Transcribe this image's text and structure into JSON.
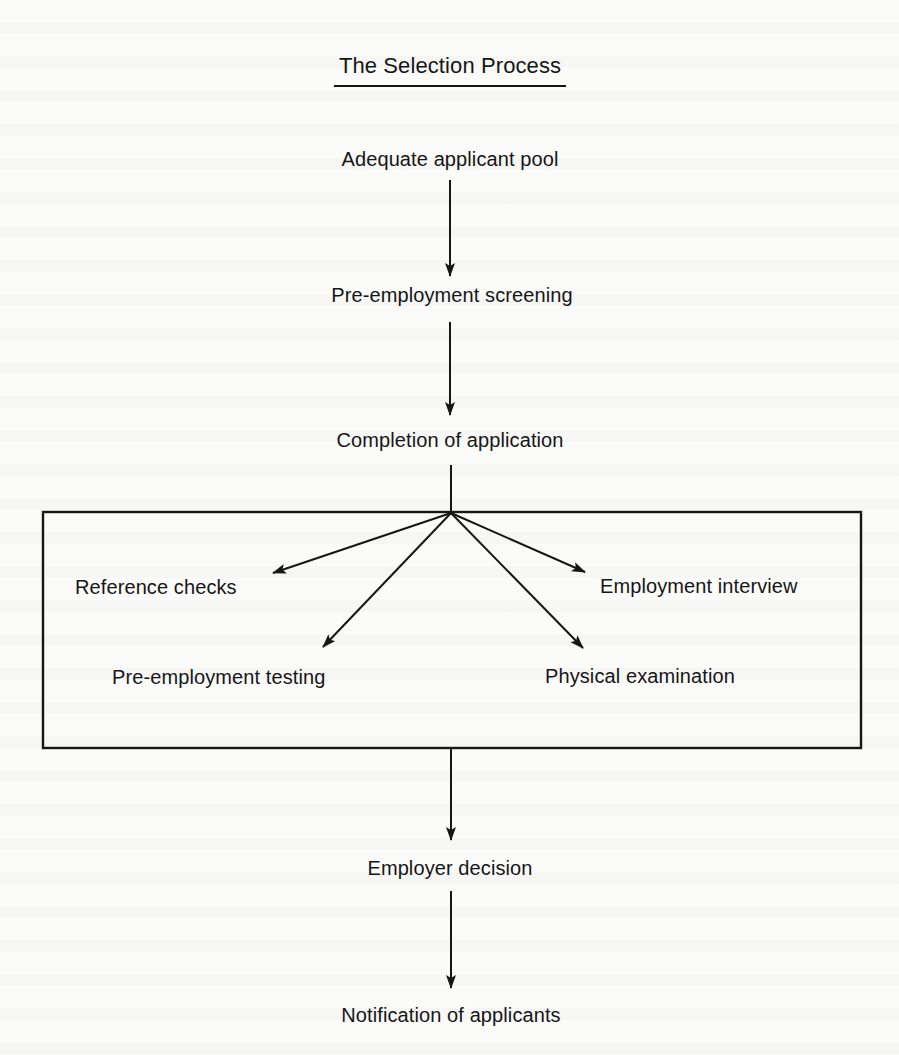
{
  "diagram": {
    "title": "The Selection Process",
    "sequential_steps": [
      {
        "id": "pool",
        "label": "Adequate applicant pool"
      },
      {
        "id": "screening",
        "label": "Pre-employment screening"
      },
      {
        "id": "application",
        "label": "Completion of application"
      }
    ],
    "parallel_box": {
      "items": [
        {
          "id": "reference",
          "label": "Reference checks"
        },
        {
          "id": "interview",
          "label": "Employment interview"
        },
        {
          "id": "testing",
          "label": "Pre-employment testing"
        },
        {
          "id": "physical",
          "label": "Physical examination"
        }
      ]
    },
    "final_steps": [
      {
        "id": "decision",
        "label": "Employer decision"
      },
      {
        "id": "notification",
        "label": "Notification of applicants"
      }
    ],
    "edges": [
      {
        "from": "pool",
        "to": "screening"
      },
      {
        "from": "screening",
        "to": "application"
      },
      {
        "from": "application",
        "to": "reference"
      },
      {
        "from": "application",
        "to": "interview"
      },
      {
        "from": "application",
        "to": "testing"
      },
      {
        "from": "application",
        "to": "physical"
      },
      {
        "from": "parallel_box",
        "to": "decision"
      },
      {
        "from": "decision",
        "to": "notification"
      }
    ],
    "colors": {
      "ink": "#161616",
      "paper": "#fbfbfa"
    }
  }
}
